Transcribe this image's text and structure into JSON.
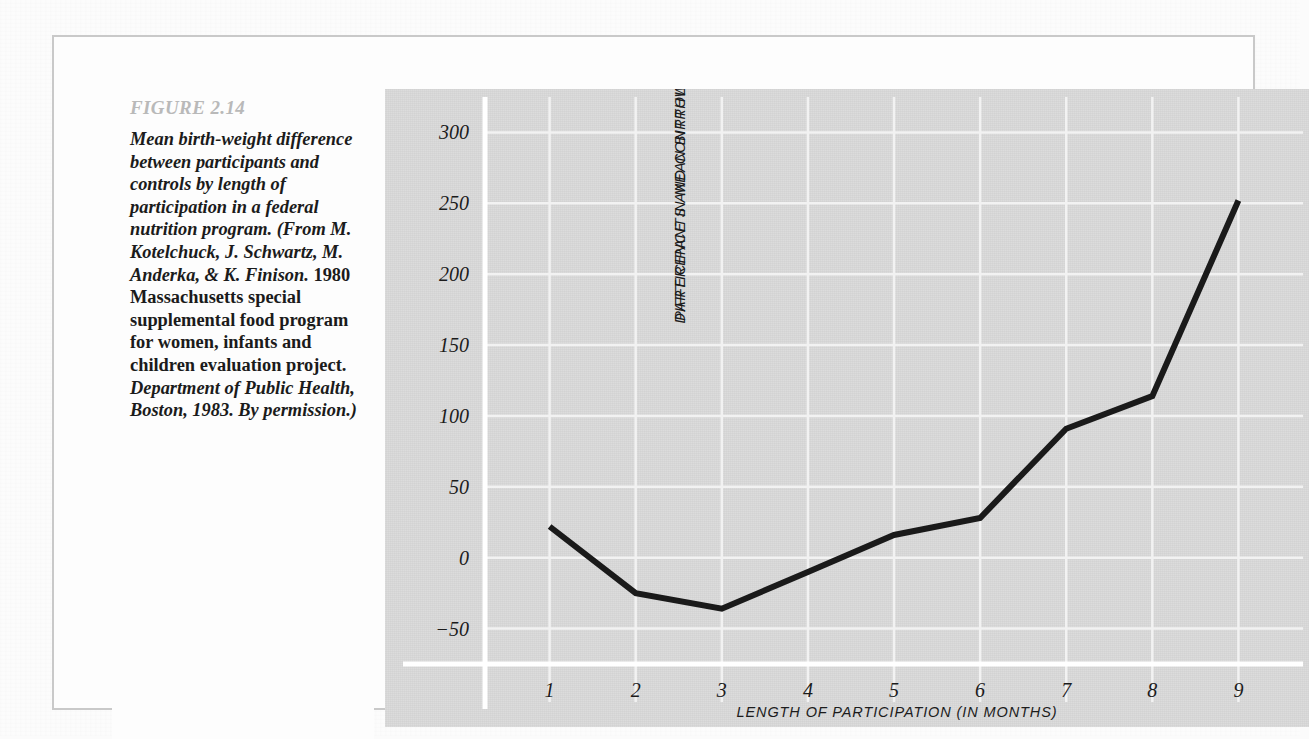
{
  "figure": {
    "label": "FIGURE 2.14",
    "caption_segments": [
      {
        "style": "italic",
        "text": "Mean birth-weight difference between participants and controls by length of participation in a federal nutrition program. (From M. Kotelchuck, J. Schwartz, M. Anderka, & K. Finison. "
      },
      {
        "style": "roman",
        "text": "1980 Massachusetts special supplemental food program for women, infants and children evaluation project. "
      },
      {
        "style": "italic",
        "text": "Department of Public Health, Boston, 1983. By permission.)"
      }
    ],
    "caption_plain": "Mean birth-weight difference between participants and controls by length of participation in a federal nutrition program. (From M. Kotelchuck, J. Schwartz, M. Anderka, & K. Finison. 1980 Massachusetts special supplemental food program for women, infants and children evaluation project. Department of Public Health, Boston, 1983. By permission.)"
  },
  "colors": {
    "page_background": "#fcfcfc",
    "figure_border": "#c9c9c9",
    "caption_background": "#fdfdfd",
    "figure_label_text": "#b9b9b9",
    "caption_text": "#1b1b1b",
    "chart_panel_background": "#d8d8d8",
    "gridline": "#f2f2f2",
    "axis_line": "#ffffff",
    "data_line": "#1a1a1a"
  },
  "chart_data": {
    "type": "line",
    "title": "",
    "xlabel": "LENGTH OF PARTICIPATION (IN MONTHS)",
    "ylabel": "DIFFERENCE IN MEAN BIRTHWEIGHTS BETWEEN PARTICIPANTS AND CONTROLS (IN GRAMS)",
    "ylabel_line1": "DIFFERENCE IN MEAN BIRTHWEIGHTS BETWEEN",
    "ylabel_line2": "PARTICIPANTS AND CONTROLS (IN GRAMS)",
    "x": [
      1,
      2,
      3,
      4,
      5,
      6,
      7,
      8,
      9
    ],
    "categories": [
      "1",
      "2",
      "3",
      "4",
      "5",
      "6",
      "7",
      "8",
      "9"
    ],
    "values": [
      22,
      -25,
      -36,
      -10,
      16,
      28,
      91,
      114,
      252
    ],
    "xtick_labels": [
      "1",
      "2",
      "3",
      "4",
      "5",
      "6",
      "7",
      "8",
      "9"
    ],
    "ytick_labels": [
      "300",
      "250",
      "200",
      "150",
      "100",
      "50",
      "0",
      "-50"
    ],
    "ytick_values": [
      300,
      250,
      200,
      150,
      100,
      50,
      0,
      -50
    ],
    "ylim": [
      -75,
      325
    ],
    "xlim": [
      0.25,
      9.75
    ],
    "grid": true,
    "legend": "none",
    "line_width_px": 6
  }
}
